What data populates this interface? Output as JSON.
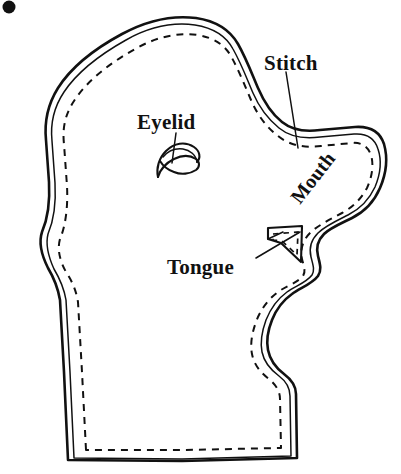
{
  "figure": {
    "background_color": "#ffffff",
    "ink_color": "#111111",
    "width": 401,
    "height": 474
  },
  "labels": {
    "eyelid": "Eyelid",
    "stitch": "Stitch",
    "mouth": "Mouth",
    "tongue": "Tongue"
  },
  "parts": {
    "outline_name": "head-profile-outline",
    "seam_name": "dashed-seam-line",
    "eyelid_shape": "eyelid-crescent",
    "tongue_shape": "tongue-triangle"
  },
  "marks": {
    "corner_dot": "•"
  }
}
